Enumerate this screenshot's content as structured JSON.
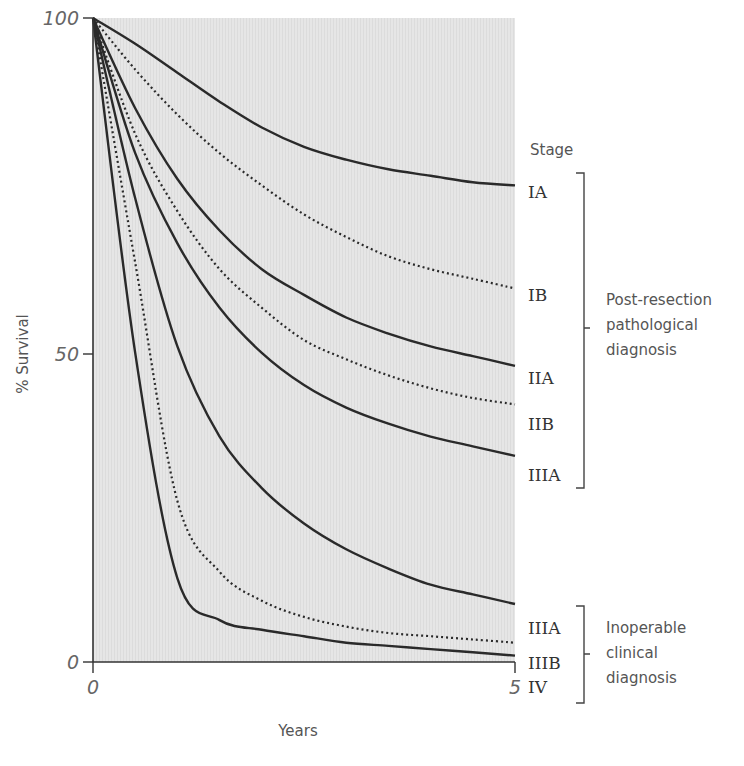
{
  "chart_data": {
    "type": "line",
    "title": "",
    "xlabel": "Years",
    "ylabel": "% Survival",
    "xlim": [
      0,
      5
    ],
    "ylim": [
      0,
      100
    ],
    "x_ticks": [
      "0",
      "5"
    ],
    "y_ticks": [
      "0",
      "50",
      "100"
    ],
    "grid": false,
    "legend_title": "Stage",
    "legend_position": "right (inline labels at curve ends)",
    "x": [
      0,
      0.5,
      1,
      1.5,
      2,
      2.5,
      3,
      3.5,
      4,
      4.5,
      5
    ],
    "series": [
      {
        "name": "IA",
        "group": "Post-resection pathological diagnosis",
        "style": "solid",
        "values": [
          100,
          96,
          91.5,
          87,
          83,
          80,
          78,
          76.5,
          75.5,
          74.5,
          74
        ]
      },
      {
        "name": "IB",
        "group": "Post-resection pathological diagnosis",
        "style": "dotted",
        "values": [
          100,
          92,
          85,
          79,
          74,
          69.5,
          66,
          63,
          61,
          59.5,
          58
        ]
      },
      {
        "name": "IIA",
        "group": "Post-resection pathological diagnosis",
        "style": "solid",
        "values": [
          100,
          86,
          75,
          67,
          61,
          57,
          53.5,
          51,
          49,
          47.5,
          46
        ]
      },
      {
        "name": "IIB",
        "group": "Post-resection pathological diagnosis",
        "style": "dotted",
        "values": [
          100,
          82,
          70,
          61,
          55,
          50,
          47,
          44.5,
          42.5,
          41,
          40
        ]
      },
      {
        "name": "IIIA",
        "group": "Post-resection pathological diagnosis",
        "style": "solid",
        "values": [
          100,
          79,
          65,
          55,
          48,
          43,
          39.5,
          37,
          35,
          33.5,
          32
        ]
      },
      {
        "name": "IIIA",
        "group": "Inoperable clinical diagnosis",
        "style": "solid",
        "values": [
          100,
          72,
          49,
          35,
          27,
          21.5,
          17.5,
          14.5,
          12,
          10.5,
          9
        ]
      },
      {
        "name": "IIIB",
        "group": "Inoperable clinical diagnosis",
        "style": "dotted",
        "values": [
          100,
          62,
          25,
          14,
          9.5,
          7,
          5.5,
          4.5,
          4,
          3.5,
          3
        ]
      },
      {
        "name": "IV",
        "group": "Inoperable clinical diagnosis",
        "style": "solid",
        "values": [
          100,
          48,
          13,
          6.5,
          5,
          4,
          3,
          2.5,
          2,
          1.5,
          1
        ]
      }
    ],
    "groups": [
      {
        "label_lines": [
          "Post-resection",
          "pathological",
          "diagnosis"
        ],
        "stages": [
          "IA",
          "IB",
          "IIA",
          "IIB",
          "IIIA"
        ]
      },
      {
        "label_lines": [
          "Inoperable",
          "clinical",
          "diagnosis"
        ],
        "stages": [
          "IIIA",
          "IIIB",
          "IV"
        ]
      }
    ]
  },
  "labels": {
    "y_tick_100": "100",
    "y_tick_50": "50",
    "y_tick_0": "0",
    "x_tick_0": "0",
    "x_tick_5": "5",
    "ylabel": "% Survival",
    "xlabel": "Years",
    "legend_title": "Stage",
    "stages": [
      "IA",
      "IB",
      "IIA",
      "IIB",
      "IIIA",
      "IIIA",
      "IIIB",
      "IV"
    ],
    "group1": [
      "Post-resection",
      "pathological",
      "diagnosis"
    ],
    "group2": [
      "Inoperable",
      "clinical",
      "diagnosis"
    ]
  },
  "colors": {
    "plot_bg": "#e4e4e4",
    "line": "#2a2a2a",
    "axis": "#333333",
    "text": "#555555"
  }
}
